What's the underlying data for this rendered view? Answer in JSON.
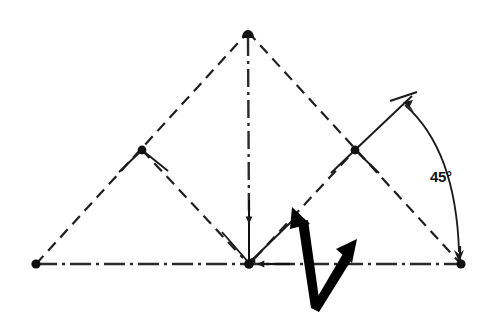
{
  "diagram": {
    "background_color": "#ffffff",
    "line_color": "#1a1a1a",
    "accent_color": "#000000",
    "annotations": {
      "angle_label": "45°",
      "angle_value": 45,
      "angle_unit": "degrees"
    },
    "vertices": [
      {
        "id": "apex",
        "label": "apex",
        "x": 248,
        "y": 32,
        "marker": "dot"
      },
      {
        "id": "left-base",
        "label": "left base corner",
        "x": 36,
        "y": 264,
        "marker": "dot"
      },
      {
        "id": "center-base",
        "label": "center base node",
        "x": 249,
        "y": 264,
        "marker": "dot"
      },
      {
        "id": "right-base",
        "label": "right base corner",
        "x": 461,
        "y": 264,
        "marker": "dot"
      },
      {
        "id": "left-mid",
        "label": "left midpoint",
        "x": 142,
        "y": 150,
        "marker": "dot"
      },
      {
        "id": "right-mid",
        "label": "right midpoint",
        "x": 355,
        "y": 150,
        "marker": "dot"
      }
    ],
    "segments": [
      {
        "id": "base-line",
        "label": "horizontal base centerline",
        "style": "dash-dot",
        "from": "left-base",
        "to": "right-base"
      },
      {
        "id": "vertical-axis",
        "label": "vertical centerline",
        "style": "dash-dot",
        "from": "apex",
        "to": "center-base"
      },
      {
        "id": "left-upper-side",
        "label": "left upper side",
        "style": "dashed",
        "from": "left-base",
        "to": "apex"
      },
      {
        "id": "right-upper-side",
        "label": "right upper side",
        "style": "dashed",
        "from": "apex",
        "to": "right-base"
      },
      {
        "id": "left-inner-side",
        "label": "left inner diagonal",
        "style": "dashed",
        "from": "left-mid",
        "to": "center-base"
      },
      {
        "id": "right-inner-side",
        "label": "right inner diagonal",
        "style": "dashed",
        "from": "center-base",
        "to": "right-mid"
      },
      {
        "id": "tick-left-mid",
        "label": "left midpoint tick",
        "style": "solid",
        "from": "left-mid",
        "to": "tick-a"
      },
      {
        "id": "extension-ray",
        "label": "upper right extension ray",
        "style": "solid",
        "from": "right-mid",
        "to": "ray-end"
      }
    ],
    "arc": {
      "id": "angle-arc",
      "label": "45 degree dimension arc",
      "style": "solid",
      "double_headed": true,
      "start": {
        "x": 404,
        "y": 103
      },
      "end": {
        "x": 460,
        "y": 258
      }
    },
    "cursor_mark": {
      "id": "pointer-arrow",
      "label": "bold double-headed pointer arrow",
      "vertex": {
        "x": 311,
        "y": 308
      },
      "tip_left": {
        "x": 293,
        "y": 209
      },
      "tip_right": {
        "x": 355,
        "y": 241
      }
    },
    "arrowheads": [
      {
        "id": "axis-arrow-down",
        "label": "downward arrow on vertical axis",
        "direction": "down"
      },
      {
        "id": "base-arrow-left",
        "label": "leftward arrow on base line",
        "direction": "left"
      },
      {
        "id": "arc-arrow-top",
        "label": "arc arrowhead at top",
        "direction": "up-left"
      },
      {
        "id": "arc-arrow-bottom",
        "label": "arc arrowhead at bottom",
        "direction": "down"
      }
    ]
  }
}
